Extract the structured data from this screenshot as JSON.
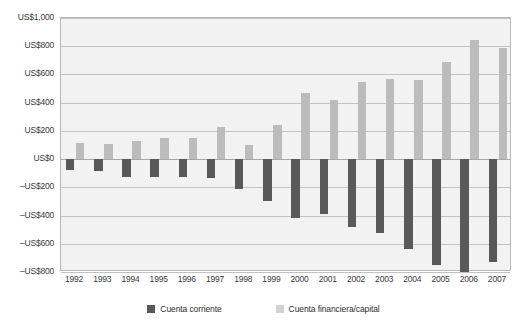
{
  "chart_data": {
    "type": "bar",
    "title": "",
    "xlabel": "",
    "ylabel": "",
    "ylim": [
      -800,
      1000
    ],
    "ytick_step": 200,
    "grid": true,
    "legend_position": "bottom",
    "currency_prefix": "US$",
    "categories": [
      "1992",
      "1993",
      "1994",
      "1995",
      "1996",
      "1997",
      "1998",
      "1999",
      "2000",
      "2001",
      "2002",
      "2003",
      "2004",
      "2005",
      "2006",
      "2007"
    ],
    "yticks": [
      1000,
      800,
      600,
      400,
      200,
      0,
      -200,
      -400,
      -600,
      -800
    ],
    "ytick_labels": [
      "US$1,000",
      "US$800",
      "US$600",
      "US$400",
      "US$200",
      "US$0",
      "–US$200",
      "–US$400",
      "–US$600",
      "–US$800"
    ],
    "series": [
      {
        "name": "Cuenta corriente",
        "color": "#595959",
        "values": [
          -75,
          -85,
          -130,
          -125,
          -125,
          -135,
          -215,
          -300,
          -415,
          -390,
          -480,
          -525,
          -640,
          -750,
          -860,
          -730
        ]
      },
      {
        "name": "Cuenta financiera/capital",
        "color": "#bcbcbc",
        "values": [
          115,
          110,
          130,
          150,
          150,
          230,
          100,
          240,
          470,
          420,
          550,
          565,
          560,
          685,
          845,
          790
        ]
      }
    ]
  },
  "legend": {
    "items": [
      {
        "label": "Cuenta corriente",
        "swatch": "neg"
      },
      {
        "label": "Cuenta financiera/capital",
        "swatch": "pos"
      }
    ]
  }
}
